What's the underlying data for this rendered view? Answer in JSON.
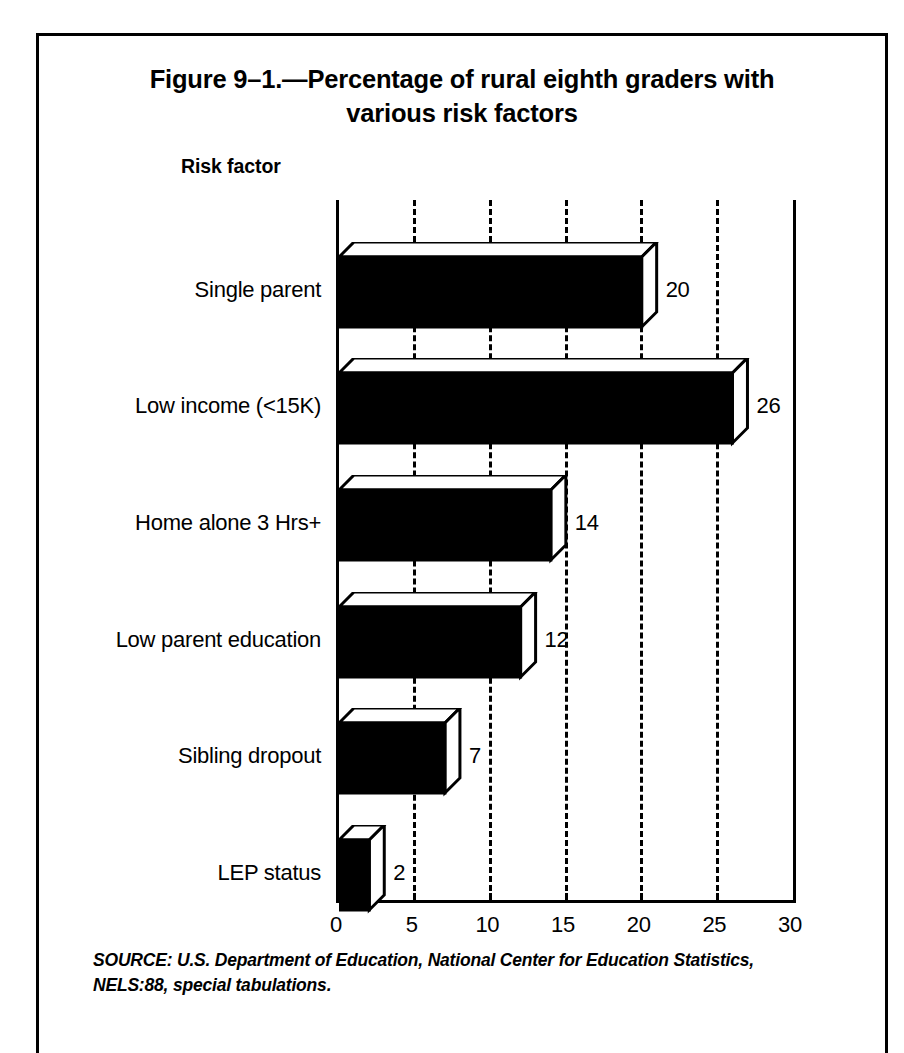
{
  "figure": {
    "title_line1": "Figure 9–1.—Percentage of rural eighth graders with",
    "title_line2": "various risk factors",
    "axis_caption": "Risk factor",
    "source_line1": "SOURCE: U.S. Department of Education, National Center for Education Statistics,",
    "source_line2": "NELS:88, special tabulations.",
    "frame_color": "#000000",
    "bar_fill_color": "#000000",
    "bar_face_color": "#ffffff",
    "background_color": "#ffffff"
  },
  "chart_data": {
    "type": "bar",
    "orientation": "horizontal",
    "title": "Figure 9–1.—Percentage of rural eighth graders with various risk factors",
    "xlabel": "",
    "ylabel": "Risk factor",
    "categories": [
      "Single parent",
      "Low income (<15K)",
      "Home alone 3 Hrs+",
      "Low parent education",
      "Sibling dropout",
      "LEP status"
    ],
    "values": [
      20,
      26,
      14,
      12,
      7,
      2
    ],
    "value_labels": [
      "20",
      "26",
      "14",
      "12",
      "7",
      "2"
    ],
    "xlim": [
      0,
      30
    ],
    "xticks": [
      0,
      5,
      10,
      15,
      20,
      25,
      30
    ],
    "xticklabels": [
      "0",
      "5",
      "10",
      "15",
      "20",
      "25",
      "30"
    ],
    "gridlines_at": [
      5,
      10,
      15,
      20,
      25
    ],
    "grid": true,
    "grid_style": "dashed",
    "legend": false,
    "style": "3d-block",
    "units": "percent"
  }
}
